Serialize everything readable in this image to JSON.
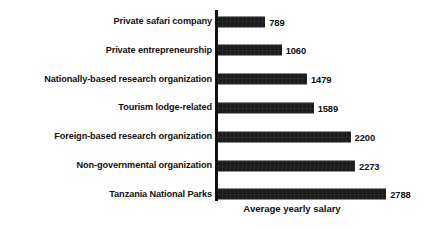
{
  "chart_data": {
    "type": "bar",
    "orientation": "horizontal",
    "title": "",
    "xlabel": "Average yearly salary",
    "ylabel": "",
    "xlim": [
      0,
      2788
    ],
    "grid": false,
    "legend": null,
    "value_labels_shown": true,
    "categories": [
      "Private safari company",
      "Private entrepreneurship",
      "Nationally-based research organization",
      "Tourism lodge-related",
      "Foreign-based research organization",
      "Non-governmental organization",
      "Tanzania National Parks"
    ],
    "values": [
      789,
      1060,
      1479,
      1589,
      2200,
      2273,
      2788
    ],
    "value_label_texts": [
      "789",
      "1060",
      "1479",
      "1589",
      "2200",
      "2273",
      "2788"
    ],
    "bar_color": "#1b1b1b",
    "axis_color": "#111111",
    "background_color": "#ffffff"
  },
  "chart": {
    "axis_title": "Average yearly salary",
    "rows": [
      {
        "label": "Private safari company",
        "value": 789,
        "value_text": "789"
      },
      {
        "label": "Private entrepreneurship",
        "value": 1060,
        "value_text": "1060"
      },
      {
        "label": "Nationally-based research organization",
        "value": 1479,
        "value_text": "1479"
      },
      {
        "label": "Tourism lodge-related",
        "value": 1589,
        "value_text": "1589"
      },
      {
        "label": "Foreign-based research organization",
        "value": 2200,
        "value_text": "2200"
      },
      {
        "label": "Non-governmental organization",
        "value": 2273,
        "value_text": "2273"
      },
      {
        "label": "Tanzania National Parks",
        "value": 2788,
        "value_text": "2788"
      }
    ]
  },
  "layout": {
    "axis_left_px": 217.5,
    "row_top_start_px": 8,
    "row_pitch_px": 28.8,
    "px_per_unit": 0.0605
  }
}
